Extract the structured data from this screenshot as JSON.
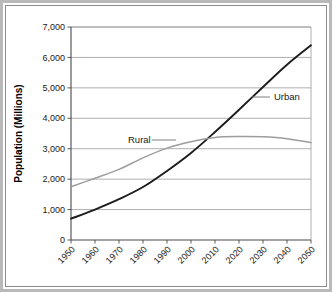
{
  "chart_data": {
    "type": "line",
    "title": "",
    "xlabel": "",
    "ylabel": "Population (Millions)",
    "xlim": [
      1950,
      2050
    ],
    "ylim": [
      0,
      7000
    ],
    "grid": true,
    "legend_position": "inline-labels",
    "x": [
      1950,
      1960,
      1970,
      1980,
      1990,
      2000,
      2010,
      2020,
      2030,
      2040,
      2050
    ],
    "xtick_labels": [
      "1950",
      "1960",
      "1970",
      "1980",
      "1990",
      "2000",
      "2010",
      "2020",
      "2030",
      "2040",
      "2050"
    ],
    "ytick_values": [
      0,
      1000,
      2000,
      3000,
      4000,
      5000,
      6000,
      7000
    ],
    "ytick_labels": [
      "0",
      "1,000",
      "2,000",
      "3,000",
      "4,000",
      "5,000",
      "6,000",
      "7,000"
    ],
    "series": [
      {
        "name": "Urban",
        "color": "#1c1c1c",
        "width": 1.9,
        "values": [
          700,
          1000,
          1340,
          1740,
          2270,
          2860,
          3550,
          4280,
          5030,
          5760,
          6400
        ]
      },
      {
        "name": "Rural",
        "color": "#9d9d9d",
        "width": 1.5,
        "values": [
          1750,
          2030,
          2320,
          2700,
          3020,
          3230,
          3370,
          3400,
          3390,
          3330,
          3200
        ]
      }
    ],
    "annotations": [
      {
        "text": "Urban",
        "series": "Urban",
        "x_px": 274,
        "y_px": 100,
        "leader_from_px": 252,
        "leader_to_px": 270
      },
      {
        "text": "Rural",
        "series": "Rural",
        "x_px": 128,
        "y_px": 143,
        "leader_from_px": 152,
        "leader_to_px": 176
      }
    ]
  },
  "figure": {
    "border_color": "#b9b9b9",
    "frame_color": "#8d8d8d",
    "background": "#ffffff"
  }
}
